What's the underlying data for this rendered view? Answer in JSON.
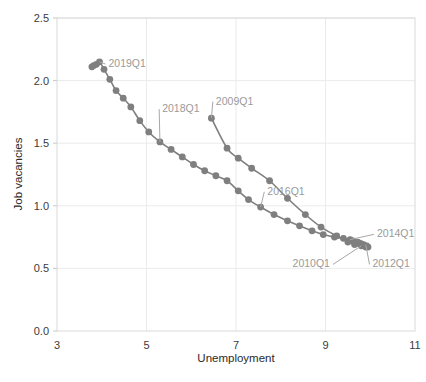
{
  "chart_data": {
    "type": "line",
    "title": "",
    "subtitle": "",
    "xlabel": "Unemployment",
    "ylabel": "Job vacancies",
    "xlim": [
      3,
      11
    ],
    "ylim": [
      0.0,
      2.5
    ],
    "xticks": [
      "3",
      "5",
      "7",
      "9",
      "11"
    ],
    "xtick_values": [
      3,
      5,
      7,
      9,
      11
    ],
    "yticks": [
      "0.0",
      "0.5",
      "1.0",
      "1.5",
      "2.0",
      "2.5"
    ],
    "ytick_values": [
      0.0,
      0.5,
      1.0,
      1.5,
      2.0,
      2.5
    ],
    "grid": true,
    "legend": "none",
    "marker": "circle",
    "marker_color": "#7f7f7f",
    "line_color": "#7f7f7f",
    "series": [
      {
        "name": "Beveridge curve path",
        "x": [
          6.45,
          6.8,
          7.05,
          7.35,
          7.75,
          8.15,
          8.55,
          8.9,
          9.25,
          9.5,
          9.65,
          9.8,
          9.9,
          9.95,
          9.88,
          9.82,
          9.92,
          9.85,
          9.78,
          9.7,
          9.72,
          9.62,
          9.55,
          9.4,
          9.2,
          8.95,
          8.7,
          8.42,
          8.15,
          7.85,
          7.55,
          7.28,
          7.05,
          6.8,
          6.55,
          6.3,
          6.05,
          5.8,
          5.55,
          5.3,
          5.05,
          4.85,
          4.65,
          4.48,
          4.32,
          4.18,
          4.05,
          3.95,
          3.88,
          3.82,
          3.78
        ],
        "y": [
          1.7,
          1.46,
          1.38,
          1.3,
          1.2,
          1.06,
          0.93,
          0.83,
          0.76,
          0.71,
          0.69,
          0.68,
          0.67,
          0.67,
          0.68,
          0.69,
          0.68,
          0.69,
          0.7,
          0.7,
          0.71,
          0.72,
          0.73,
          0.74,
          0.75,
          0.77,
          0.8,
          0.84,
          0.88,
          0.93,
          0.99,
          1.05,
          1.12,
          1.2,
          1.24,
          1.28,
          1.33,
          1.39,
          1.45,
          1.51,
          1.59,
          1.68,
          1.79,
          1.86,
          1.92,
          2.01,
          2.09,
          2.15,
          2.13,
          2.12,
          2.11
        ]
      }
    ],
    "annotations": [
      {
        "label": "2009Q1",
        "point_x": 6.45,
        "point_y": 1.7,
        "text_x": 6.55,
        "text_y": 1.84
      },
      {
        "label": "2010Q1",
        "point_x": 9.8,
        "point_y": 0.68,
        "text_x": 9.1,
        "text_y": 0.54
      },
      {
        "label": "2012Q1",
        "point_x": 9.9,
        "point_y": 0.69,
        "text_x": 10.05,
        "text_y": 0.54
      },
      {
        "label": "2014Q1",
        "point_x": 9.55,
        "point_y": 0.73,
        "text_x": 10.15,
        "text_y": 0.78
      },
      {
        "label": "2016Q1",
        "point_x": 7.55,
        "point_y": 0.99,
        "text_x": 7.7,
        "text_y": 1.12
      },
      {
        "label": "2018Q1",
        "point_x": 5.3,
        "point_y": 1.51,
        "text_x": 5.35,
        "text_y": 1.78
      },
      {
        "label": "2019Q1",
        "point_x": 3.95,
        "point_y": 2.15,
        "text_x": 4.15,
        "text_y": 2.14
      }
    ]
  },
  "axes": {
    "x_title": "Unemployment",
    "y_title": "Job vacancies"
  }
}
